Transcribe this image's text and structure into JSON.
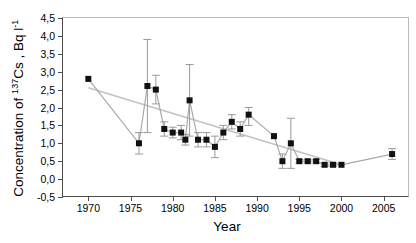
{
  "chart_data": {
    "type": "line",
    "title": "",
    "xlabel": "Year",
    "ylabel_html": "Concentration of <sup>137</sup>Cs , Bq l<sup>-1</sup>",
    "ylabel_text": "Concentration of 137Cs , Bq l-1",
    "xlim": [
      1967,
      2008
    ],
    "ylim": [
      -0.5,
      4.5
    ],
    "xticks": [
      1970,
      1975,
      1980,
      1985,
      1990,
      1995,
      2000,
      2005
    ],
    "xtick_labels": [
      "1970",
      "1975",
      "1980",
      "1985",
      "1990",
      "1995",
      "2000",
      "2005"
    ],
    "yticks": [
      -0.5,
      0.0,
      0.5,
      1.0,
      1.5,
      2.0,
      2.5,
      3.0,
      3.5,
      4.0,
      4.5
    ],
    "ytick_labels": [
      "-0,5",
      "0,0",
      "0,5",
      "1,0",
      "1,5",
      "2,0",
      "2,5",
      "3,0",
      "3,5",
      "4,0",
      "4,5"
    ],
    "grid": false,
    "legend": "none",
    "decimal_separator": ",",
    "marker": "filled-square",
    "marker_color": "#111111",
    "line_color": "#a9a9a9",
    "errorbar_color": "#9a9a9a",
    "trend_line_color": "#c2c2c2",
    "series": [
      {
        "name": "Cs-137 concentration",
        "x": [
          1970,
          1976,
          1977,
          1978,
          1979,
          1980,
          1981,
          1981.5,
          1982,
          1983,
          1984,
          1985,
          1986,
          1987,
          1988,
          1989,
          1992,
          1993,
          1994,
          1995,
          1996,
          1997,
          1998,
          1999,
          2000,
          2006
        ],
        "values": [
          2.8,
          1.0,
          2.6,
          2.5,
          1.4,
          1.3,
          1.3,
          1.1,
          2.2,
          1.1,
          1.1,
          0.9,
          1.3,
          1.6,
          1.4,
          1.8,
          1.2,
          0.5,
          1.0,
          0.5,
          0.5,
          0.5,
          0.4,
          0.4,
          0.4,
          0.7
        ],
        "err_low": [
          0.0,
          0.3,
          1.3,
          0.4,
          0.2,
          0.15,
          0.2,
          0.15,
          1.0,
          0.2,
          0.2,
          0.3,
          0.2,
          0.2,
          0.2,
          0.3,
          0.0,
          0.2,
          0.7,
          0.05,
          0.05,
          0.05,
          0.05,
          0.05,
          0.0,
          0.15
        ],
        "err_high": [
          0.0,
          0.3,
          1.3,
          0.4,
          0.2,
          0.15,
          0.2,
          0.15,
          1.0,
          0.2,
          0.2,
          0.3,
          0.2,
          0.2,
          0.2,
          0.2,
          0.0,
          0.2,
          0.7,
          0.05,
          0.05,
          0.05,
          0.05,
          0.05,
          0.0,
          0.15
        ]
      },
      {
        "name": "trend",
        "style": "line-only",
        "x": [
          1970,
          2000
        ],
        "values": [
          2.55,
          0.4
        ]
      }
    ]
  },
  "labels": {
    "xaxis_title": "Year",
    "yaxis_title_lead": "Concentration of ",
    "yaxis_sup1": "137",
    "yaxis_mid": "Cs , Bq l",
    "yaxis_sup2": "-1"
  }
}
